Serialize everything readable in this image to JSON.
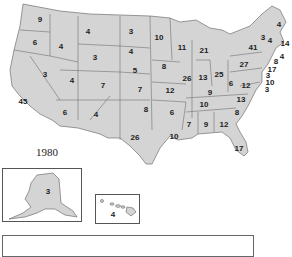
{
  "year": "1980",
  "colors": {
    "state_fill": "#d4d4d4",
    "border": "#707070",
    "text": "#222222"
  },
  "states": [
    {
      "name": "WA",
      "votes": "9",
      "x": 40,
      "y": 19
    },
    {
      "name": "OR",
      "votes": "6",
      "x": 35,
      "y": 42
    },
    {
      "name": "CA",
      "votes": "45",
      "x": 23,
      "y": 101
    },
    {
      "name": "ID",
      "votes": "4",
      "x": 61,
      "y": 46
    },
    {
      "name": "NV",
      "votes": "3",
      "x": 45,
      "y": 74
    },
    {
      "name": "MT",
      "votes": "4",
      "x": 88,
      "y": 31
    },
    {
      "name": "WY",
      "votes": "3",
      "x": 95,
      "y": 57
    },
    {
      "name": "UT",
      "votes": "4",
      "x": 72,
      "y": 80
    },
    {
      "name": "CO",
      "votes": "7",
      "x": 103,
      "y": 85
    },
    {
      "name": "AZ",
      "votes": "6",
      "x": 65,
      "y": 112
    },
    {
      "name": "NM",
      "votes": "4",
      "x": 96,
      "y": 114
    },
    {
      "name": "ND",
      "votes": "3",
      "x": 131,
      "y": 31
    },
    {
      "name": "SD",
      "votes": "4",
      "x": 131,
      "y": 51
    },
    {
      "name": "NE",
      "votes": "5",
      "x": 135,
      "y": 70
    },
    {
      "name": "KS",
      "votes": "7",
      "x": 140,
      "y": 89
    },
    {
      "name": "OK",
      "votes": "8",
      "x": 146,
      "y": 109
    },
    {
      "name": "TX",
      "votes": "26",
      "x": 135,
      "y": 137
    },
    {
      "name": "MN",
      "votes": "10",
      "x": 159,
      "y": 37
    },
    {
      "name": "IA",
      "votes": "8",
      "x": 164,
      "y": 66
    },
    {
      "name": "MO",
      "votes": "12",
      "x": 170,
      "y": 90
    },
    {
      "name": "AR",
      "votes": "6",
      "x": 172,
      "y": 112
    },
    {
      "name": "LA",
      "votes": "10",
      "x": 174,
      "y": 136
    },
    {
      "name": "WI",
      "votes": "11",
      "x": 182,
      "y": 47
    },
    {
      "name": "IL",
      "votes": "26",
      "x": 187,
      "y": 78
    },
    {
      "name": "MI",
      "votes": "21",
      "x": 204,
      "y": 50
    },
    {
      "name": "IN",
      "votes": "13",
      "x": 203,
      "y": 77
    },
    {
      "name": "OH",
      "votes": "25",
      "x": 219,
      "y": 74
    },
    {
      "name": "KY",
      "votes": "9",
      "x": 210,
      "y": 92
    },
    {
      "name": "TN",
      "votes": "10",
      "x": 204,
      "y": 104
    },
    {
      "name": "MS",
      "votes": "7",
      "x": 189,
      "y": 124
    },
    {
      "name": "AL",
      "votes": "9",
      "x": 206,
      "y": 124
    },
    {
      "name": "GA",
      "votes": "12",
      "x": 224,
      "y": 124
    },
    {
      "name": "FL",
      "votes": "17",
      "x": 239,
      "y": 148
    },
    {
      "name": "SC",
      "votes": "8",
      "x": 237,
      "y": 112
    },
    {
      "name": "NC",
      "votes": "13",
      "x": 241,
      "y": 99
    },
    {
      "name": "VA",
      "votes": "12",
      "x": 246,
      "y": 85
    },
    {
      "name": "WV",
      "votes": "6",
      "x": 231,
      "y": 83
    },
    {
      "name": "PA",
      "votes": "27",
      "x": 244,
      "y": 64
    },
    {
      "name": "NY",
      "votes": "41",
      "x": 253,
      "y": 47
    },
    {
      "name": "VT",
      "votes": "3",
      "x": 263,
      "y": 37
    },
    {
      "name": "NH",
      "votes": "4",
      "x": 270,
      "y": 40
    },
    {
      "name": "ME",
      "votes": "4",
      "x": 279,
      "y": 24
    },
    {
      "name": "MA",
      "votes": "14",
      "x": 285,
      "y": 43
    },
    {
      "name": "RI",
      "votes": "4",
      "x": 282,
      "y": 56
    },
    {
      "name": "CT",
      "votes": "8",
      "x": 276,
      "y": 61
    },
    {
      "name": "NJ",
      "votes": "17",
      "x": 272,
      "y": 69
    },
    {
      "name": "DE",
      "votes": "3",
      "x": 268,
      "y": 75
    },
    {
      "name": "MD",
      "votes": "10",
      "x": 270,
      "y": 82
    },
    {
      "name": "DC",
      "votes": "3",
      "x": 267,
      "y": 89
    }
  ],
  "insets": {
    "alaska": {
      "name": "AK",
      "votes": "3"
    },
    "hawaii": {
      "name": "HI",
      "votes": "4"
    }
  }
}
